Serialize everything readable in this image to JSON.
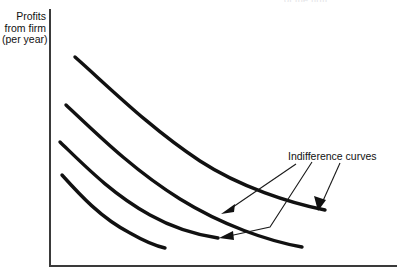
{
  "figure": {
    "background_color": "#ffffff",
    "clipped_header_text": "of the firm",
    "axis": {
      "color": "#3a3a3a",
      "y_label_lines": [
        "Profits",
        "from firm",
        "(per year)"
      ],
      "y_label_text": "Profits\nfrom firm\n(per year)",
      "x_label_text": ""
    },
    "annotation": {
      "text": "Indifference curves",
      "color": "#111111",
      "arrow_count": 3
    },
    "curve_color": "#111111"
  },
  "chart_data": {
    "type": "line",
    "title": "",
    "subtitle": "",
    "xlabel": "",
    "ylabel": "Profits from firm (per year)",
    "xlim": [
      0,
      1
    ],
    "ylim": [
      0,
      1
    ],
    "grid": false,
    "legend_position": "none",
    "axis_style": "L-shaped spine, no tick marks, no tick labels",
    "annotations": [
      {
        "text": "Indifference curves",
        "x_px": 288,
        "y_px": 150,
        "arrow_targets_px": [
          [
            222,
            211
          ],
          [
            220,
            237
          ],
          [
            318,
            208
          ]
        ]
      }
    ],
    "series": [
      {
        "name": "Indifference curve 4 (highest utility)",
        "utility_rank": 4,
        "points_px": [
          [
            75,
            57
          ],
          [
            120,
            99
          ],
          [
            175,
            146
          ],
          [
            240,
            181
          ],
          [
            290,
            200
          ],
          [
            325,
            210
          ]
        ],
        "path": "M 75 57 C 110 88, 150 128, 200 161 C 240 187, 290 203, 325 210"
      },
      {
        "name": "Indifference curve 3",
        "utility_rank": 3,
        "points_px": [
          [
            66,
            105
          ],
          [
            108,
            144
          ],
          [
            160,
            185
          ],
          [
            220,
            219
          ],
          [
            270,
            239
          ],
          [
            302,
            247
          ]
        ],
        "path": "M 66 105 C 96 133, 133 170, 180 199 C 222 225, 268 241, 302 247"
      },
      {
        "name": "Indifference curve 2",
        "utility_rank": 2,
        "points_px": [
          [
            60,
            142
          ],
          [
            95,
            176
          ],
          [
            134,
            207
          ],
          [
            178,
            228
          ],
          [
            218,
            238
          ]
        ],
        "path": "M 60 142 C 85 166, 112 194, 150 215 C 175 229, 198 235, 218 238"
      },
      {
        "name": "Indifference curve 1 (lowest utility)",
        "utility_rank": 1,
        "points_px": [
          [
            62,
            175
          ],
          [
            90,
            203
          ],
          [
            122,
            228
          ],
          [
            150,
            242
          ],
          [
            165,
            248
          ]
        ],
        "path": "M 62 175 C 80 195, 101 218, 130 233 C 144 241, 156 246, 165 248"
      }
    ]
  }
}
